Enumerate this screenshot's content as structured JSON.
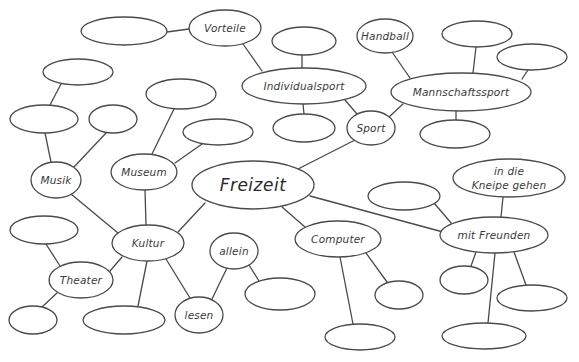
{
  "diagram": {
    "type": "mind-map",
    "central_topic": "Freizeit",
    "style": {
      "stroke_color": "#4a4a4a",
      "text_color": "#3a3a3a",
      "background": "#ffffff"
    },
    "nodes": [
      {
        "id": "freizeit",
        "label": "Freizeit",
        "cx": 253,
        "cy": 185,
        "rx": 61,
        "ry": 24,
        "central": true
      },
      {
        "id": "sport",
        "label": "Sport",
        "cx": 371,
        "cy": 128,
        "rx": 24,
        "ry": 17
      },
      {
        "id": "individual",
        "label": "Individualsport",
        "cx": 304,
        "cy": 86,
        "rx": 62,
        "ry": 18
      },
      {
        "id": "vorteile",
        "label": "Vorteile",
        "cx": 225,
        "cy": 28,
        "rx": 36,
        "ry": 18
      },
      {
        "id": "e_vorteile",
        "label": "",
        "cx": 124,
        "cy": 31,
        "rx": 43,
        "ry": 14
      },
      {
        "id": "e_ind_top",
        "label": "",
        "cx": 304,
        "cy": 41,
        "rx": 32,
        "ry": 14
      },
      {
        "id": "e_ind_bot",
        "label": "",
        "cx": 304,
        "cy": 128,
        "rx": 31,
        "ry": 14
      },
      {
        "id": "mannschaft",
        "label": "Mannschaftssport",
        "cx": 461,
        "cy": 92,
        "rx": 70,
        "ry": 19
      },
      {
        "id": "handball",
        "label": "Handball",
        "cx": 385,
        "cy": 36,
        "rx": 28,
        "ry": 17
      },
      {
        "id": "e_mann_top",
        "label": "",
        "cx": 477,
        "cy": 34,
        "rx": 35,
        "ry": 13
      },
      {
        "id": "e_mann_right",
        "label": "",
        "cx": 532,
        "cy": 57,
        "rx": 35,
        "ry": 13
      },
      {
        "id": "e_mann_bot",
        "label": "",
        "cx": 455,
        "cy": 134,
        "rx": 35,
        "ry": 14
      },
      {
        "id": "kultur",
        "label": "Kultur",
        "cx": 148,
        "cy": 243,
        "rx": 36,
        "ry": 18
      },
      {
        "id": "musik",
        "label": "Musik",
        "cx": 56,
        "cy": 180,
        "rx": 25,
        "ry": 18
      },
      {
        "id": "e_musik_left",
        "label": "",
        "cx": 44,
        "cy": 119,
        "rx": 34,
        "ry": 14
      },
      {
        "id": "e_musik_top",
        "label": "",
        "cx": 78,
        "cy": 72,
        "rx": 35,
        "ry": 13
      },
      {
        "id": "e_musik_small",
        "label": "",
        "cx": 113,
        "cy": 119,
        "rx": 24,
        "ry": 14
      },
      {
        "id": "museum",
        "label": "Museum",
        "cx": 144,
        "cy": 172,
        "rx": 33,
        "ry": 18
      },
      {
        "id": "e_museum_top",
        "label": "",
        "cx": 181,
        "cy": 94,
        "rx": 35,
        "ry": 15
      },
      {
        "id": "e_museum_right",
        "label": "",
        "cx": 218,
        "cy": 132,
        "rx": 35,
        "ry": 13
      },
      {
        "id": "theater",
        "label": "Theater",
        "cx": 81,
        "cy": 280,
        "rx": 32,
        "ry": 18
      },
      {
        "id": "e_theater_top",
        "label": "",
        "cx": 44,
        "cy": 230,
        "rx": 34,
        "ry": 14
      },
      {
        "id": "e_theater_bot",
        "label": "",
        "cx": 33,
        "cy": 320,
        "rx": 24,
        "ry": 14
      },
      {
        "id": "e_kultur_bot",
        "label": "",
        "cx": 124,
        "cy": 320,
        "rx": 41,
        "ry": 14
      },
      {
        "id": "lesen",
        "label": "lesen",
        "cx": 199,
        "cy": 315,
        "rx": 24,
        "ry": 18
      },
      {
        "id": "allein",
        "label": "allein",
        "cx": 234,
        "cy": 251,
        "rx": 24,
        "ry": 18
      },
      {
        "id": "e_allein",
        "label": "",
        "cx": 280,
        "cy": 294,
        "rx": 35,
        "ry": 16
      },
      {
        "id": "computer",
        "label": "Computer",
        "cx": 338,
        "cy": 239,
        "rx": 43,
        "ry": 18
      },
      {
        "id": "e_comp_small",
        "label": "",
        "cx": 399,
        "cy": 295,
        "rx": 24,
        "ry": 14
      },
      {
        "id": "e_comp_bot",
        "label": "",
        "cx": 360,
        "cy": 337,
        "rx": 35,
        "ry": 13
      },
      {
        "id": "freunde",
        "label": "mit Freunden",
        "cx": 494,
        "cy": 235,
        "rx": 54,
        "ry": 18
      },
      {
        "id": "kneipe",
        "label": "in die",
        "label2": "Kneipe gehen",
        "cx": 509,
        "cy": 178,
        "rx": 56,
        "ry": 19
      },
      {
        "id": "e_freunde_left",
        "label": "",
        "cx": 404,
        "cy": 196,
        "rx": 36,
        "ry": 14
      },
      {
        "id": "e_freunde_small",
        "label": "",
        "cx": 464,
        "cy": 280,
        "rx": 24,
        "ry": 14
      },
      {
        "id": "e_freunde_right",
        "label": "",
        "cx": 532,
        "cy": 298,
        "rx": 35,
        "ry": 13
      },
      {
        "id": "e_freunde_bot",
        "label": "",
        "cx": 484,
        "cy": 336,
        "rx": 42,
        "ry": 13
      }
    ],
    "edges": [
      {
        "from": "freizeit",
        "to": "sport",
        "x1": 298,
        "y1": 169,
        "x2": 355,
        "y2": 140
      },
      {
        "from": "sport",
        "to": "individual",
        "x1": 357,
        "y1": 114,
        "x2": 345,
        "y2": 100
      },
      {
        "from": "sport",
        "to": "mannschaft",
        "x1": 389,
        "y1": 117,
        "x2": 403,
        "y2": 104
      },
      {
        "from": "individual",
        "to": "vorteile",
        "x1": 262,
        "y1": 71,
        "x2": 243,
        "y2": 44
      },
      {
        "from": "vorteile",
        "to": "e_vorteile",
        "x1": 189,
        "y1": 29,
        "x2": 167,
        "y2": 32
      },
      {
        "from": "individual",
        "to": "e_ind_top",
        "x1": 302,
        "y1": 68,
        "x2": 302,
        "y2": 55
      },
      {
        "from": "individual",
        "to": "e_ind_bot",
        "x1": 303,
        "y1": 104,
        "x2": 304,
        "y2": 114
      },
      {
        "from": "mannschaft",
        "to": "handball",
        "x1": 410,
        "y1": 78,
        "x2": 392,
        "y2": 52
      },
      {
        "from": "mannschaft",
        "to": "e_mann_top",
        "x1": 473,
        "y1": 73,
        "x2": 476,
        "y2": 47
      },
      {
        "from": "mannschaft",
        "to": "e_mann_right",
        "x1": 522,
        "y1": 79,
        "x2": 528,
        "y2": 70
      },
      {
        "from": "mannschaft",
        "to": "e_mann_bot",
        "x1": 456,
        "y1": 111,
        "x2": 456,
        "y2": 121
      },
      {
        "from": "freizeit",
        "to": "kultur",
        "x1": 205,
        "y1": 203,
        "x2": 178,
        "y2": 232
      },
      {
        "from": "kultur",
        "to": "musik",
        "x1": 118,
        "y1": 233,
        "x2": 71,
        "y2": 194
      },
      {
        "from": "kultur",
        "to": "museum",
        "x1": 146,
        "y1": 225,
        "x2": 145,
        "y2": 190
      },
      {
        "from": "kultur",
        "to": "theater",
        "x1": 122,
        "y1": 257,
        "x2": 110,
        "y2": 271
      },
      {
        "from": "kultur",
        "to": "e_kultur_bot",
        "x1": 147,
        "y1": 261,
        "x2": 138,
        "y2": 306
      },
      {
        "from": "kultur",
        "to": "lesen",
        "x1": 166,
        "y1": 259,
        "x2": 190,
        "y2": 298
      },
      {
        "from": "musik",
        "to": "e_musik_left",
        "x1": 51,
        "y1": 162,
        "x2": 45,
        "y2": 133
      },
      {
        "from": "e_musik_left",
        "to": "e_musik_top",
        "x1": 50,
        "y1": 105,
        "x2": 61,
        "y2": 84
      },
      {
        "from": "musik",
        "to": "e_musik_small",
        "x1": 74,
        "y1": 167,
        "x2": 106,
        "y2": 133
      },
      {
        "from": "museum",
        "to": "e_museum_top",
        "x1": 152,
        "y1": 154,
        "x2": 174,
        "y2": 109
      },
      {
        "from": "museum",
        "to": "e_museum_right",
        "x1": 175,
        "y1": 163,
        "x2": 202,
        "y2": 144
      },
      {
        "from": "theater",
        "to": "e_theater_top",
        "x1": 60,
        "y1": 266,
        "x2": 46,
        "y2": 244
      },
      {
        "from": "theater",
        "to": "e_theater_bot",
        "x1": 57,
        "y1": 293,
        "x2": 42,
        "y2": 307
      },
      {
        "from": "lesen",
        "to": "allein",
        "x1": 212,
        "y1": 299,
        "x2": 227,
        "y2": 268
      },
      {
        "from": "allein",
        "to": "e_allein",
        "x1": 249,
        "y1": 265,
        "x2": 259,
        "y2": 281
      },
      {
        "from": "freizeit",
        "to": "computer",
        "x1": 282,
        "y1": 207,
        "x2": 305,
        "y2": 227
      },
      {
        "from": "computer",
        "to": "e_comp_small",
        "x1": 366,
        "y1": 253,
        "x2": 387,
        "y2": 282
      },
      {
        "from": "computer",
        "to": "e_comp_bot",
        "x1": 340,
        "y1": 257,
        "x2": 353,
        "y2": 324
      },
      {
        "from": "freizeit",
        "to": "freunde",
        "x1": 310,
        "y1": 196,
        "x2": 443,
        "y2": 232
      },
      {
        "from": "freunde",
        "to": "kneipe",
        "x1": 501,
        "y1": 217,
        "x2": 503,
        "y2": 197
      },
      {
        "from": "freunde",
        "to": "e_freunde_left",
        "x1": 452,
        "y1": 224,
        "x2": 434,
        "y2": 203
      },
      {
        "from": "freunde",
        "to": "e_freunde_small",
        "x1": 476,
        "y1": 252,
        "x2": 471,
        "y2": 266
      },
      {
        "from": "freunde",
        "to": "e_freunde_right",
        "x1": 514,
        "y1": 252,
        "x2": 526,
        "y2": 285
      },
      {
        "from": "freunde",
        "to": "e_freunde_bot",
        "x1": 495,
        "y1": 253,
        "x2": 488,
        "y2": 323
      }
    ]
  }
}
